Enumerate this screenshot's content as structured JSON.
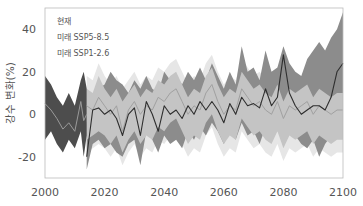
{
  "chart_data": {
    "type": "area",
    "title": "",
    "xlabel": "",
    "ylabel": "강수 변화(%)",
    "xlim": [
      2000,
      2100
    ],
    "ylim": [
      -30,
      50
    ],
    "xticks": [
      2000,
      2020,
      2040,
      2060,
      2080,
      2100
    ],
    "yticks": [
      -20,
      0,
      20,
      40
    ],
    "grid": false,
    "legend_position": "upper-left",
    "legend": [
      "현재",
      "미래 SSP5-8.5",
      "미래 SSP1-2.6"
    ],
    "colors": {
      "historical_band": "#4d4d4d",
      "ssp585_band": "#8c8c8c",
      "ssp126_band": "#c4c4c4",
      "ssp126_outer_band": "#e6e6e6",
      "ssp585_line": "#2e2e2e",
      "ssp126_line": "#a0a0a0",
      "historical_line": "#9a9a9a",
      "axis": "#bbbbbb"
    },
    "series": [
      {
        "name": "현재",
        "x": [
          2000,
          2002,
          2004,
          2006,
          2008,
          2010,
          2012,
          2013,
          2014
        ],
        "mean": [
          5,
          2,
          -2,
          -7,
          -4,
          -8,
          6,
          -3,
          0
        ],
        "upper": [
          18,
          14,
          8,
          4,
          10,
          4,
          16,
          20,
          12
        ],
        "lower": [
          -12,
          -8,
          -14,
          -18,
          -12,
          -16,
          -8,
          -20,
          -10
        ]
      },
      {
        "name": "미래 SSP5-8.5",
        "x": [
          2014,
          2016,
          2018,
          2020,
          2022,
          2024,
          2026,
          2028,
          2030,
          2032,
          2034,
          2036,
          2038,
          2040,
          2042,
          2044,
          2046,
          2048,
          2050,
          2052,
          2054,
          2056,
          2058,
          2060,
          2062,
          2064,
          2066,
          2068,
          2070,
          2072,
          2074,
          2076,
          2078,
          2080,
          2082,
          2084,
          2086,
          2088,
          2090,
          2092,
          2094,
          2096,
          2098,
          2100
        ],
        "mean": [
          -20,
          2,
          3,
          0,
          2,
          -2,
          -10,
          0,
          3,
          -10,
          6,
          0,
          -8,
          4,
          0,
          2,
          -2,
          4,
          0,
          6,
          2,
          6,
          2,
          -4,
          5,
          0,
          8,
          4,
          5,
          3,
          12,
          4,
          8,
          28,
          10,
          4,
          0,
          2,
          4,
          4,
          2,
          8,
          20,
          24
        ],
        "upper": [
          -4,
          10,
          12,
          14,
          20,
          16,
          14,
          10,
          16,
          12,
          18,
          12,
          10,
          20,
          16,
          18,
          14,
          20,
          16,
          22,
          16,
          24,
          18,
          12,
          20,
          14,
          32,
          20,
          22,
          16,
          30,
          20,
          22,
          32,
          24,
          20,
          18,
          26,
          30,
          34,
          30,
          36,
          40,
          48
        ],
        "lower": [
          -26,
          -14,
          -12,
          -16,
          -14,
          -18,
          -20,
          -14,
          -12,
          -24,
          -8,
          -12,
          -18,
          -10,
          -14,
          -12,
          -16,
          -8,
          -12,
          -6,
          -10,
          -4,
          -8,
          -14,
          -8,
          -12,
          -4,
          -10,
          -8,
          -14,
          -6,
          -10,
          -8,
          0,
          -6,
          -10,
          -14,
          -16,
          -12,
          -20,
          -14,
          -10,
          -4,
          0
        ]
      },
      {
        "name": "미래 SSP1-2.6",
        "x": [
          2014,
          2016,
          2018,
          2020,
          2022,
          2024,
          2026,
          2028,
          2030,
          2032,
          2034,
          2036,
          2038,
          2040,
          2042,
          2044,
          2046,
          2048,
          2050,
          2052,
          2054,
          2056,
          2058,
          2060,
          2062,
          2064,
          2066,
          2068,
          2070,
          2072,
          2074,
          2076,
          2078,
          2080,
          2082,
          2084,
          2086,
          2088,
          2090,
          2092,
          2094,
          2096,
          2098,
          2100
        ],
        "mean": [
          4,
          2,
          8,
          4,
          0,
          4,
          -8,
          2,
          6,
          0,
          4,
          2,
          8,
          6,
          10,
          12,
          6,
          0,
          4,
          2,
          10,
          14,
          6,
          0,
          4,
          2,
          12,
          8,
          4,
          6,
          2,
          0,
          6,
          -2,
          4,
          2,
          4,
          6,
          0,
          4,
          2,
          0,
          2,
          2
        ],
        "upper": [
          12,
          10,
          18,
          12,
          8,
          12,
          6,
          10,
          14,
          8,
          12,
          10,
          16,
          14,
          18,
          20,
          14,
          8,
          12,
          10,
          18,
          22,
          14,
          8,
          12,
          10,
          20,
          16,
          12,
          14,
          10,
          8,
          14,
          6,
          12,
          10,
          12,
          14,
          8,
          12,
          10,
          8,
          10,
          10
        ],
        "lower": [
          -12,
          -10,
          -8,
          -10,
          -14,
          -10,
          -18,
          -12,
          -8,
          -14,
          -10,
          -12,
          -6,
          -8,
          -4,
          -2,
          -8,
          -14,
          -10,
          -12,
          -4,
          0,
          -8,
          -14,
          -10,
          -12,
          -2,
          -6,
          -10,
          -8,
          -12,
          -14,
          -8,
          -16,
          -10,
          -12,
          -10,
          -8,
          -14,
          -10,
          -12,
          -14,
          -12,
          -12
        ]
      }
    ]
  }
}
